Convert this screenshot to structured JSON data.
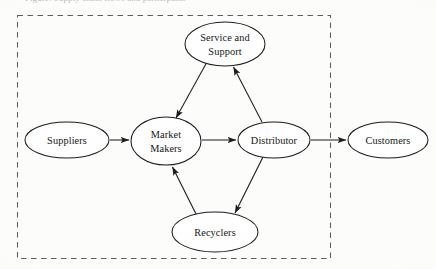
{
  "figure": {
    "clipped_caption": "Figure: Supply chain flows and participants",
    "boundary": {
      "name": "enclosed-system-boundary",
      "style": "dashed",
      "x": 17,
      "y": 15,
      "width": 313,
      "height": 243,
      "color": "#5d5d5d"
    },
    "stroke_color": "#1d1d1d",
    "fill_color": "#ffffff",
    "background": "#fdfdfc"
  },
  "nodes": [
    {
      "id": "suppliers",
      "label": "Suppliers",
      "lines": [
        "Suppliers"
      ],
      "cx": 67,
      "cy": 140,
      "rx": 42,
      "ry": 18,
      "inside_boundary": false
    },
    {
      "id": "market-makers",
      "label": "Market Makers",
      "lines": [
        "Market",
        "Makers"
      ],
      "cx": 166,
      "cy": 141,
      "rx": 35,
      "ry": 24,
      "inside_boundary": true
    },
    {
      "id": "service-and-support",
      "label": "Service and Support",
      "lines": [
        "Service and",
        "Support"
      ],
      "cx": 225,
      "cy": 44,
      "rx": 40,
      "ry": 22,
      "inside_boundary": true
    },
    {
      "id": "distributor",
      "label": "Distributor",
      "lines": [
        "Distributor"
      ],
      "cx": 274,
      "cy": 140,
      "rx": 36,
      "ry": 18,
      "inside_boundary": true
    },
    {
      "id": "recyclers",
      "label": "Recyclers",
      "lines": [
        "Recyclers"
      ],
      "cx": 215,
      "cy": 232,
      "rx": 43,
      "ry": 20,
      "inside_boundary": true
    },
    {
      "id": "customers",
      "label": "Customers",
      "lines": [
        "Customers"
      ],
      "cx": 388,
      "cy": 140,
      "rx": 40,
      "ry": 18,
      "inside_boundary": false
    }
  ],
  "edges": [
    {
      "id": "suppliers-to-market-makers",
      "from": "Suppliers",
      "to": "Market Makers",
      "x1": 110,
      "y1": 140,
      "x2": 129,
      "y2": 140
    },
    {
      "id": "market-makers-to-distributor",
      "from": "Market Makers",
      "to": "Distributor",
      "x1": 202,
      "y1": 140,
      "x2": 236,
      "y2": 140
    },
    {
      "id": "distributor-to-customers",
      "from": "Distributor",
      "to": "Customers",
      "x1": 311,
      "y1": 140,
      "x2": 346,
      "y2": 140
    },
    {
      "id": "distributor-to-service",
      "from": "Distributor",
      "to": "Service and Support",
      "x1": 262,
      "y1": 122,
      "x2": 233,
      "y2": 66
    },
    {
      "id": "service-to-market-makers",
      "from": "Service and Support",
      "to": "Market Makers",
      "x1": 207,
      "y1": 63,
      "x2": 176,
      "y2": 118
    },
    {
      "id": "distributor-to-recyclers",
      "from": "Distributor",
      "to": "Recyclers",
      "x1": 263,
      "y1": 157,
      "x2": 234,
      "y2": 214
    },
    {
      "id": "recyclers-to-market-makers",
      "from": "Recyclers",
      "to": "Market Makers",
      "x1": 196,
      "y1": 214,
      "x2": 172,
      "y2": 167
    }
  ]
}
